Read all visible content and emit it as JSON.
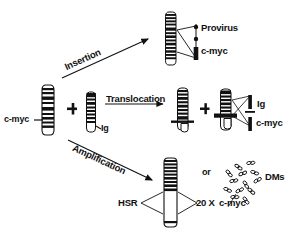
{
  "figure": {
    "background_color": "#ffffff",
    "ink_color": "#111111"
  },
  "labels": {
    "source_gene": "c-myc",
    "pathway_insertion": "Insertion",
    "pathway_translocation": "Translocation",
    "pathway_amplification": "Amplification",
    "plus_1": "+",
    "plus_2": "+",
    "ig_partner": "Ig",
    "provirus": "Provirus",
    "insertion_cmyc": "c-myc",
    "product_ig": "Ig",
    "product_cmyc": "c-myc",
    "hsr": "HSR",
    "copy_number": "20 X",
    "amplified_gene": "c-myc",
    "or": "or",
    "dms": "DMs"
  },
  "diagram_data": {
    "type": "diagram",
    "pathways": [
      {
        "name": "Insertion",
        "inputs": [
          "c-myc chromosome"
        ],
        "outputs": [
          "chromosome with Provirus inserted near c-myc"
        ],
        "annotations": [
          "Provirus",
          "c-myc"
        ]
      },
      {
        "name": "Translocation",
        "inputs": [
          "c-myc chromosome",
          "Ig chromosome"
        ],
        "outputs": [
          "derivative chromosome 1",
          "derivative chromosome 2"
        ],
        "annotations": [
          "Ig",
          "c-myc"
        ]
      },
      {
        "name": "Amplification",
        "inputs": [
          "c-myc chromosome"
        ],
        "outputs": [
          "HSR chromosome (20 X c-myc)",
          "Double minutes (DMs)"
        ],
        "annotations": [
          "HSR",
          "20 X",
          "c-myc",
          "or",
          "DMs"
        ]
      }
    ]
  }
}
